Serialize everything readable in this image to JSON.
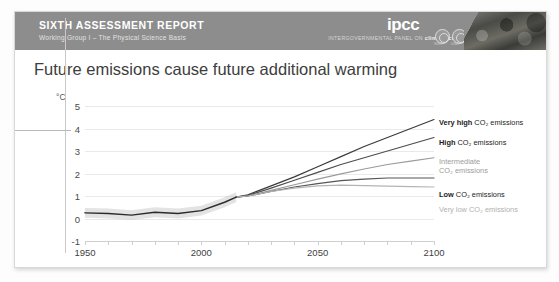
{
  "banner": {
    "title": "SIXTH ASSESSMENT REPORT",
    "subtitle": "Working Group I – The Physical Science Basis",
    "wordmark": "ipcc",
    "tagline_prefix": "INTERGOVERNMENTAL PANEL ON ",
    "tagline_bold": "climate change",
    "logo_a_caption": "WMO",
    "logo_b_caption": "UNEP",
    "bg_color": "#8d8d8d"
  },
  "chart_data": {
    "type": "line",
    "title": "Future emissions cause future additional warming",
    "xlabel": "",
    "ylabel": "°C",
    "unit": "°C",
    "xlim": [
      1950,
      2100
    ],
    "ylim": [
      -1,
      5
    ],
    "xticks": [
      1950,
      2000,
      2050,
      2100
    ],
    "yticks": [
      5,
      4,
      3,
      2,
      1,
      0,
      -1
    ],
    "grid": true,
    "legend_position": "right",
    "x": [
      1950,
      1960,
      1970,
      1980,
      1990,
      2000,
      2010,
      2015,
      2020,
      2030,
      2040,
      2050,
      2060,
      2070,
      2080,
      2090,
      2100
    ],
    "series": [
      {
        "name": "Very high CO2 emissions",
        "label_bold": "Very high",
        "label_rest": " CO₂ emissions",
        "color": "#3a3a3a",
        "values": [
          null,
          null,
          null,
          null,
          null,
          null,
          null,
          0.95,
          1.05,
          1.45,
          1.85,
          2.3,
          2.75,
          3.2,
          3.6,
          4.0,
          4.4
        ]
      },
      {
        "name": "High CO2 emissions",
        "label_bold": "High",
        "label_rest": " CO₂ emissions",
        "color": "#4d4d4d",
        "values": [
          null,
          null,
          null,
          null,
          null,
          null,
          null,
          0.95,
          1.02,
          1.35,
          1.7,
          2.05,
          2.4,
          2.7,
          3.0,
          3.3,
          3.6
        ]
      },
      {
        "name": "Intermediate CO2 emissions",
        "label_bold": "Intermediate",
        "label_rest": " CO₂ emissions",
        "color": "#9b9b9b",
        "values": [
          null,
          null,
          null,
          null,
          null,
          null,
          null,
          0.95,
          1.0,
          1.25,
          1.5,
          1.75,
          1.98,
          2.2,
          2.4,
          2.55,
          2.7
        ]
      },
      {
        "name": "Low CO2 emissions",
        "label_bold": "Low",
        "label_rest": " CO₂ emissions",
        "color": "#555555",
        "values": [
          null,
          null,
          null,
          null,
          null,
          null,
          null,
          0.95,
          1.0,
          1.2,
          1.4,
          1.55,
          1.68,
          1.75,
          1.8,
          1.8,
          1.8
        ]
      },
      {
        "name": "Very low CO2 emissions",
        "label_bold": "Very low",
        "label_rest": " CO₂ emissions",
        "color": "#b4b4b4",
        "values": [
          null,
          null,
          null,
          null,
          null,
          null,
          null,
          0.95,
          1.0,
          1.2,
          1.35,
          1.45,
          1.48,
          1.46,
          1.44,
          1.42,
          1.4
        ]
      },
      {
        "name": "Observed historical warming",
        "label_bold": "",
        "label_rest": "",
        "color": "#2b2b2b",
        "values": [
          0.25,
          0.22,
          0.15,
          0.28,
          0.22,
          0.35,
          0.72,
          0.95,
          null,
          null,
          null,
          null,
          null,
          null,
          null,
          null,
          null
        ]
      }
    ]
  }
}
